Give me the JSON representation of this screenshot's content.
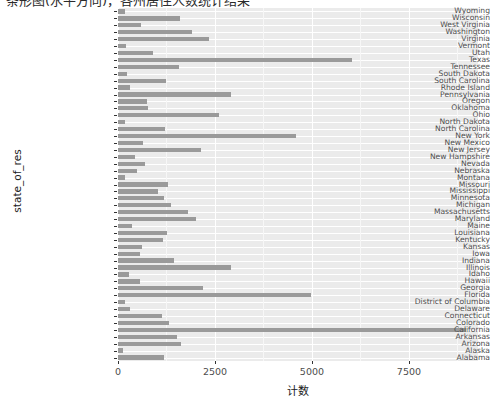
{
  "title": {
    "text": "条形图(水平方向)，各州居住人数统计结果"
  },
  "axes": {
    "y_label": "state_of_res",
    "x_label": "计数",
    "x_ticks": [
      0,
      2500,
      5000,
      7500
    ],
    "x_tick_labels": [
      "0",
      "2500",
      "5000",
      "7500"
    ],
    "x_minor_ticks": [
      1250,
      3750,
      6250,
      8750
    ]
  },
  "style": {
    "panel_bg": "#ebebeb",
    "grid_major": "#ffffff",
    "grid_minor": "#f7f7f7",
    "bar_color": "#9a9a9a",
    "tick_text": "#4d4d4d",
    "axis_title": "#1a1a1a"
  },
  "chart_data": {
    "type": "bar",
    "orientation": "horizontal",
    "title": "条形图(水平方向)，各州居住人数统计结果",
    "xlabel": "计数",
    "ylabel": "state_of_res",
    "xlim": [
      0,
      9280
    ],
    "grid": true,
    "legend": null,
    "categories": [
      "Wyoming",
      "Wisconsin",
      "West Virginia",
      "Washington",
      "Virginia",
      "Vermont",
      "Utah",
      "Texas",
      "Tennessee",
      "South Dakota",
      "South Carolina",
      "Rhode Island",
      "Pennsylvania",
      "Oregon",
      "Oklahoma",
      "Ohio",
      "North Dakota",
      "North Carolina",
      "New York",
      "New Mexico",
      "New Jersey",
      "New Hampshire",
      "Nevada",
      "Nebraska",
      "Montana",
      "Missouri",
      "Mississippi",
      "Minnesota",
      "Michigan",
      "Massachusetts",
      "Maryland",
      "Maine",
      "Louisiana",
      "Kentucky",
      "Kansas",
      "Iowa",
      "Indiana",
      "Illinois",
      "Idaho",
      "Hawaii",
      "Georgia",
      "Florida",
      "District of Columbia",
      "Delaware",
      "Connecticut",
      "Colorado",
      "California",
      "Arkansas",
      "Arizona",
      "Alaska",
      "Alabama"
    ],
    "values": [
      180,
      1590,
      600,
      1900,
      2350,
      200,
      900,
      6030,
      1580,
      230,
      1240,
      300,
      2900,
      750,
      780,
      2600,
      180,
      1220,
      4600,
      640,
      2150,
      430,
      690,
      490,
      170,
      1300,
      1030,
      1190,
      1370,
      1800,
      2000,
      360,
      1270,
      1160,
      620,
      570,
      1450,
      2900,
      280,
      560,
      2200,
      4980,
      180,
      310,
      1130,
      1320,
      8960,
      1530,
      1620,
      130,
      1180
    ]
  }
}
